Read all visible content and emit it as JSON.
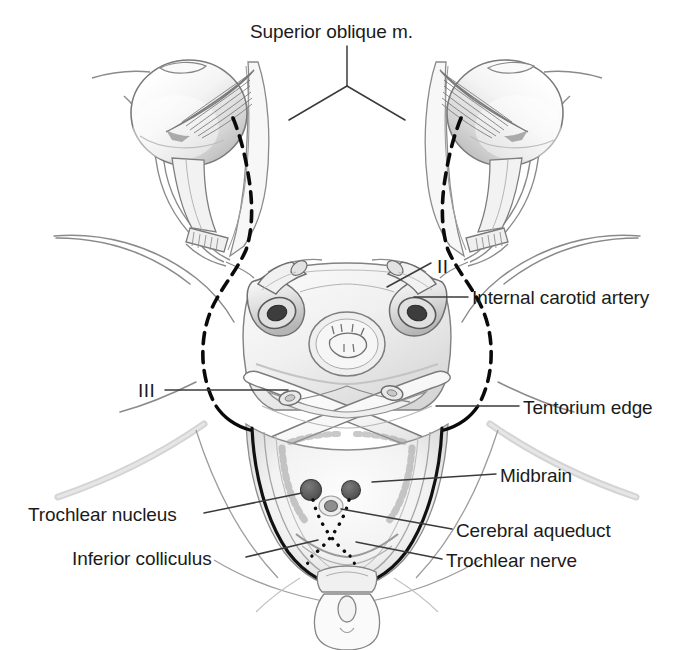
{
  "figure": {
    "background_color": "#ffffff",
    "width": 694,
    "height": 650,
    "ink_color": "#1b1b1b",
    "line_color": "#6e6e6e",
    "nerve_color": "#000000"
  },
  "labels": {
    "superior_oblique": "Superior oblique m.",
    "optic_nerve_roman": "II",
    "internal_carotid": "Internal carotid artery",
    "oculomotor_roman": "III",
    "tentorium_edge": "Tentorium edge",
    "midbrain": "Midbrain",
    "trochlear_nucleus": "Trochlear nucleus",
    "cerebral_aqueduct": "Cerebral aqueduct",
    "inferior_colliculus": "Inferior colliculus",
    "trochlear_nerve": "Trochlear nerve"
  },
  "structures": {
    "left_eyeball": "left-eyeball",
    "right_eyeball": "right-eyeball",
    "left_superior_oblique_muscle": "left-superior-oblique-muscle",
    "right_superior_oblique_muscle": "right-superior-oblique-muscle",
    "left_optic_nerve": "left-optic-nerve",
    "right_optic_nerve": "right-optic-nerve",
    "left_internal_carotid_artery": "left-internal-carotid-artery",
    "right_internal_carotid_artery": "right-internal-carotid-artery",
    "pituitary_sella": "pituitary-sella",
    "tentorium_left_edge": "tentorium-left-edge",
    "tentorium_right_edge": "tentorium-right-edge",
    "midbrain_section": "midbrain-cross-section",
    "left_trochlear_nucleus": "left-trochlear-nucleus",
    "right_trochlear_nucleus": "right-trochlear-nucleus",
    "cerebral_aqueduct_opening": "cerebral-aqueduct-opening",
    "inferior_colliculus_region": "inferior-colliculus-region",
    "trochlear_nerve_decussation": "trochlear-nerve-decussation",
    "left_trochlear_nerve_path": "left-trochlear-nerve-path",
    "right_trochlear_nerve_path": "right-trochlear-nerve-path",
    "skull_base_outline": "skull-base-outline",
    "petrous_ridge_left": "petrous-ridge-left",
    "petrous_ridge_right": "petrous-ridge-right",
    "foramen_magnum_region": "foramen-magnum-region"
  },
  "label_positions": {
    "superior_oblique": {
      "x": 250,
      "y": 22
    },
    "optic_nerve_roman": {
      "x": 437,
      "y": 257
    },
    "internal_carotid": {
      "x": 472,
      "y": 288
    },
    "oculomotor_roman": {
      "x": 138,
      "y": 381
    },
    "tentorium_edge": {
      "x": 523,
      "y": 398
    },
    "midbrain": {
      "x": 500,
      "y": 466
    },
    "trochlear_nucleus": {
      "x": 28,
      "y": 505
    },
    "cerebral_aqueduct": {
      "x": 456,
      "y": 521
    },
    "inferior_colliculus": {
      "x": 72,
      "y": 549
    },
    "trochlear_nerve": {
      "x": 446,
      "y": 551
    }
  }
}
